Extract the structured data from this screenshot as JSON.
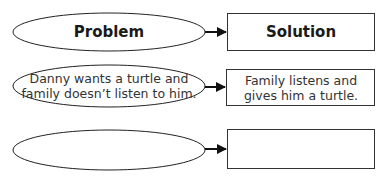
{
  "diagram": {
    "type": "problem-solution organizer",
    "stroke_color": "#222222",
    "headers": {
      "problem": "Problem",
      "solution": "Solution"
    },
    "rows": [
      {
        "problem": "Danny wants a turtle and family doesn’t listen to him.",
        "solution": "Family listens and gives him a turtle."
      },
      {
        "problem": "",
        "solution": ""
      }
    ]
  }
}
